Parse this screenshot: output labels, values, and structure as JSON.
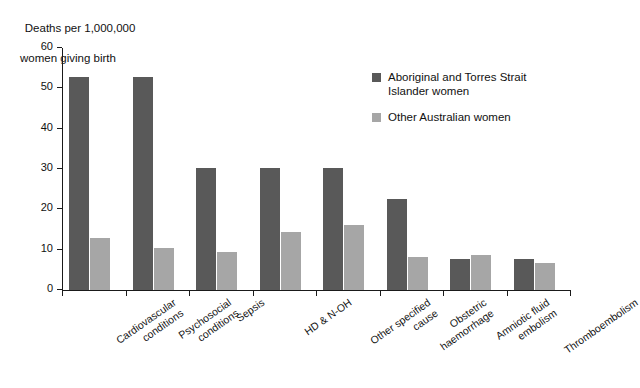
{
  "chart_data": {
    "type": "bar",
    "title": "",
    "ylabel": "Deaths per 1,000,000 women giving birth",
    "xlabel": "",
    "ylim": [
      0,
      60
    ],
    "yticks": [
      0,
      10,
      20,
      30,
      40,
      50,
      60
    ],
    "grid": false,
    "legend_position": "top-right",
    "categories": [
      "Cardiovascular conditions",
      "Psychosocial conditions",
      "Sepsis",
      "HD & N-OH",
      "Other specified cause",
      "Obstetric haemorrhage",
      "Amniotic fluid embolism",
      "Thromboembolism"
    ],
    "series": [
      {
        "name": "Aboriginal and Torres Strait Islander women",
        "color": "#595959",
        "values": [
          52.7,
          52.7,
          30.2,
          30.2,
          30.2,
          22.6,
          7.7,
          7.8
        ]
      },
      {
        "name": "Other Australian women",
        "color": "#a6a6a6",
        "values": [
          12.9,
          10.5,
          9.4,
          14.3,
          16.1,
          8.1,
          8.8,
          6.7
        ]
      }
    ]
  },
  "axis_title": {
    "line1": "Deaths per 1,000,000",
    "line2": "women giving birth"
  },
  "category_labels": [
    {
      "l1": "Cardiovascular",
      "l2": "conditions"
    },
    {
      "l1": "Psychosocial",
      "l2": "conditions"
    },
    {
      "l1": "Sepsis",
      "l2": ""
    },
    {
      "l1": "HD & N-OH",
      "l2": ""
    },
    {
      "l1": "Other specified",
      "l2": "cause"
    },
    {
      "l1": "Obstetric",
      "l2": "haemorrhage"
    },
    {
      "l1": "Amniotic fluid",
      "l2": "embolism"
    },
    {
      "l1": "Thromboembolism",
      "l2": ""
    }
  ],
  "legend": {
    "items": [
      {
        "label_line1": "Aboriginal and Torres Strait",
        "label_line2": "Islander women",
        "color": "#595959"
      },
      {
        "label_line1": "Other Australian women",
        "label_line2": "",
        "color": "#a6a6a6"
      }
    ]
  },
  "ytick_labels": [
    "0",
    "10",
    "20",
    "30",
    "40",
    "50",
    "60"
  ]
}
